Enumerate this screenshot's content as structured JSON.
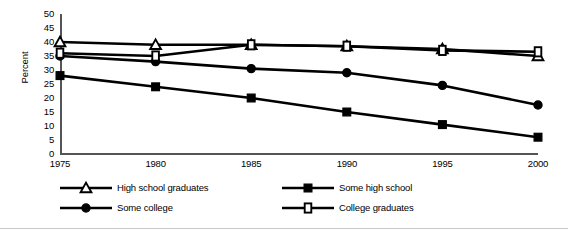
{
  "chart_data": {
    "type": "line",
    "title": "",
    "xlabel": "",
    "ylabel": "Percent",
    "categories": [
      "1975",
      "1980",
      "1985",
      "1990",
      "1995",
      "2000"
    ],
    "x": [
      1975,
      1980,
      1985,
      1990,
      1995,
      2000
    ],
    "xlim": [
      1975,
      2000
    ],
    "ylim": [
      0,
      50
    ],
    "ytick_labels": [
      "50",
      "45",
      "40",
      "35",
      "30",
      "25",
      "20",
      "15",
      "10",
      "5",
      "0"
    ],
    "ytick_values": [
      50,
      45,
      40,
      35,
      30,
      25,
      20,
      15,
      10,
      5,
      0
    ],
    "grid": false,
    "legend_position": "bottom",
    "series": [
      {
        "name": "High school graduates",
        "marker": "open-triangle",
        "values": [
          40,
          39,
          39,
          38.5,
          37.5,
          35
        ]
      },
      {
        "name": "Some high school",
        "marker": "filled-square",
        "values": [
          28,
          24,
          20,
          15,
          10.5,
          6
        ]
      },
      {
        "name": "Some college",
        "marker": "filled-circle",
        "values": [
          35,
          33,
          30.5,
          29,
          24.5,
          17.5
        ]
      },
      {
        "name": "College graduates",
        "marker": "open-square",
        "values": [
          36,
          35,
          39,
          38.5,
          37,
          36.5
        ]
      }
    ]
  },
  "axes": {
    "y_title": "Percent"
  },
  "legend": {
    "entries": [
      {
        "label": "High school graduates",
        "marker": "open-triangle"
      },
      {
        "label": "Some high school",
        "marker": "filled-square"
      },
      {
        "label": "Some college",
        "marker": "filled-circle"
      },
      {
        "label": "College graduates",
        "marker": "open-square"
      }
    ]
  },
  "colors": {
    "line": "#000000",
    "marker_fill": "#000000",
    "marker_open_fill": "#ffffff",
    "axis": "#555555",
    "rule": "#c9c9c9",
    "background": "#ffffff"
  }
}
